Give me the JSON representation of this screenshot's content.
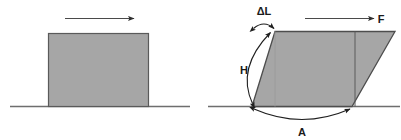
{
  "figure": {
    "background_color": "#ffffff",
    "panels": [
      {
        "id": "undeformed",
        "name": "undeformed-block-panel",
        "caption": "",
        "shape": {
          "kind": "rectangle",
          "fill_color": "#a6a6a6",
          "stroke_color": "#5a5a5a",
          "x": 48,
          "y": 33,
          "width": 100,
          "height": 73
        },
        "ground_line": {
          "color": "#6e6e6e",
          "x1": 10,
          "x2": 190,
          "y": 106
        },
        "force_arrow": {
          "name": "force-arrow-undeformed",
          "label": "",
          "color": "#4a4a4a",
          "x1": 65,
          "x2": 136,
          "y": 18
        }
      },
      {
        "id": "deformed",
        "name": "deformed-block-panel",
        "caption": "",
        "shape": {
          "kind": "parallelogram",
          "fill_color": "#a6a6a6",
          "stroke_color": "#4d4d4d",
          "bottom_left_x": 252,
          "bottom_right_x": 352,
          "top_left_x": 275,
          "top_right_x": 395,
          "top_y": 31,
          "bottom_y": 106
        },
        "original_edge_line": {
          "name": "original-right-edge",
          "color": "#5a5a5a",
          "x": 355,
          "y1": 31,
          "y2": 106
        },
        "height_guide_line": {
          "name": "original-left-edge-guide",
          "color": "#8a8a8a",
          "x": 275,
          "y1": 31,
          "y2": 106
        },
        "ground_line": {
          "color": "#6e6e6e",
          "x1": 208,
          "x2": 400,
          "y": 106
        },
        "force_arrow": {
          "name": "force-arrow-deformed",
          "color": "#4a4a4a",
          "x1": 305,
          "x2": 376,
          "y": 18
        }
      }
    ],
    "labels": {
      "delta_l": "ΔL",
      "height": "H",
      "area": "A",
      "force": "F"
    },
    "dimension_arcs": [
      {
        "name": "delta-l-arc",
        "label_key": "delta_l",
        "measures": "horizontal displacement of top face",
        "double_headed": true,
        "color": "#2b2b2b"
      },
      {
        "name": "height-arc",
        "label_key": "height",
        "measures": "block height",
        "double_headed": true,
        "color": "#2b2b2b"
      },
      {
        "name": "area-arc",
        "label_key": "area",
        "measures": "base length / area of the sheared face",
        "double_headed": true,
        "color": "#2b2b2b"
      }
    ],
    "colors": {
      "block_fill": "#a6a6a6",
      "block_stroke": "#4d4d4d",
      "ground": "#6e6e6e",
      "arrow": "#3a3a3a",
      "text": "#1a1a1a"
    }
  }
}
